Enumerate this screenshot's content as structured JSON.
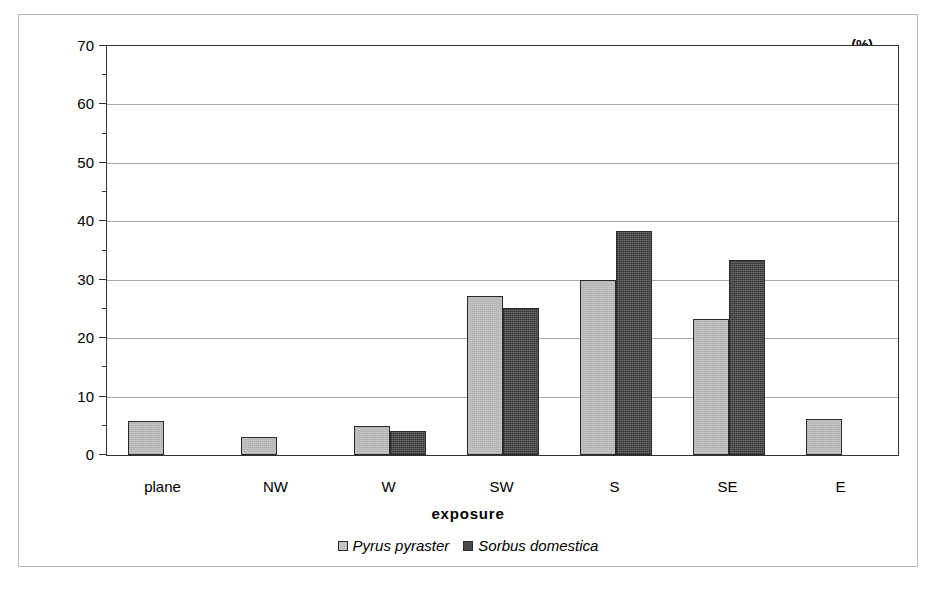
{
  "chart_data": {
    "type": "bar",
    "title": "",
    "xlabel": "exposure",
    "ylabel": "(%)",
    "unit_label": "(%)",
    "categories": [
      "plane",
      "NW",
      "W",
      "SW",
      "S",
      "SE",
      "E"
    ],
    "series": [
      {
        "name": "Pyrus pyraster",
        "color": "#c2c2c2",
        "values": [
          5.8,
          3.0,
          5.0,
          27.2,
          30.0,
          23.3,
          6.2
        ]
      },
      {
        "name": "Sorbus domestica",
        "color": "#4a4a4a",
        "values": [
          0,
          0,
          4.1,
          25.2,
          38.3,
          33.3,
          0
        ]
      }
    ],
    "ylim": [
      0,
      70
    ],
    "ytick_values": [
      0,
      10,
      20,
      30,
      40,
      50,
      60,
      70
    ],
    "ytick_labels": [
      "0",
      "10",
      "20",
      "30",
      "40",
      "50",
      "60",
      "70"
    ],
    "yminor_step": 5,
    "grid": true,
    "legend_position": "bottom"
  },
  "legend": {
    "entries": [
      {
        "label": "Pyrus pyraster",
        "swatch": "light"
      },
      {
        "label": "Sorbus domestica",
        "swatch": "dark"
      }
    ]
  }
}
